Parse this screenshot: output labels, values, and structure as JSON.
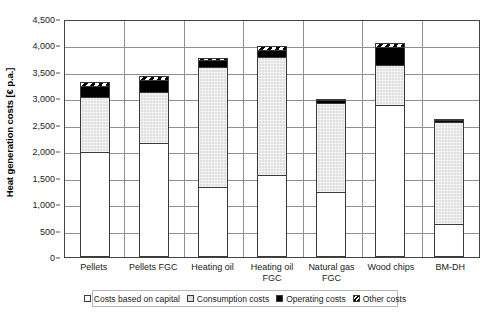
{
  "chart_data": {
    "type": "bar",
    "stacked": true,
    "title": "",
    "xlabel": "",
    "ylabel": "Heat generation costs [€ p.a.]",
    "ylim": [
      0,
      4500
    ],
    "ytick_step": 500,
    "ytick_labels": [
      "4,500",
      "4,000",
      "3,500",
      "3,000",
      "2,500",
      "2,000",
      "1,500",
      "1,000",
      "500",
      "0"
    ],
    "ytick_values": [
      4500,
      4000,
      3500,
      3000,
      2500,
      2000,
      1500,
      1000,
      500,
      0
    ],
    "grid": true,
    "legend_position": "bottom",
    "categories": [
      "Pellets",
      "Pellets FGC",
      "Heating oil",
      "Heating oil FGC",
      "Natural gas FGC",
      "Wood chips",
      "BM-DH"
    ],
    "series": [
      {
        "name": "Costs based on capital",
        "fill": "white",
        "values": [
          1980,
          2150,
          1330,
          1560,
          1230,
          2880,
          630
        ]
      },
      {
        "name": "Consumption costs",
        "fill": "light-grey",
        "values": [
          1070,
          990,
          2290,
          2240,
          1700,
          770,
          1940
        ]
      },
      {
        "name": "Operating costs",
        "fill": "black",
        "values": [
          220,
          250,
          150,
          160,
          70,
          350,
          50
        ]
      },
      {
        "name": "Other costs",
        "fill": "hatched",
        "values": [
          90,
          90,
          50,
          80,
          40,
          110,
          30
        ]
      }
    ],
    "totals": [
      3360,
      3480,
      3820,
      4040,
      3040,
      4110,
      2650
    ]
  },
  "legend": {
    "items": [
      {
        "label": "Costs based on capital",
        "swatch": "capital"
      },
      {
        "label": "Consumption costs",
        "swatch": "consumption"
      },
      {
        "label": "Operating costs",
        "swatch": "operating"
      },
      {
        "label": "Other costs",
        "swatch": "other"
      }
    ]
  },
  "colors": {
    "capital": "#ffffff",
    "consumption": "#e0e0e0",
    "operating": "#000000",
    "other": "#000000",
    "axis": "#444444",
    "grid": "#909090",
    "text": "#1a1a1a"
  }
}
